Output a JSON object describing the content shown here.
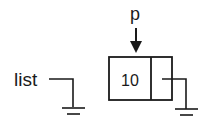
{
  "diagram": {
    "type": "linked-list",
    "pointers": {
      "list": {
        "label": "list",
        "value": "null"
      },
      "p": {
        "label": "p",
        "target": "node-1"
      }
    },
    "nodes": [
      {
        "id": "node-1",
        "data": "10",
        "next": "null"
      }
    ],
    "colors": {
      "stroke": "#1a1a1a",
      "background": "#ffffff"
    }
  }
}
